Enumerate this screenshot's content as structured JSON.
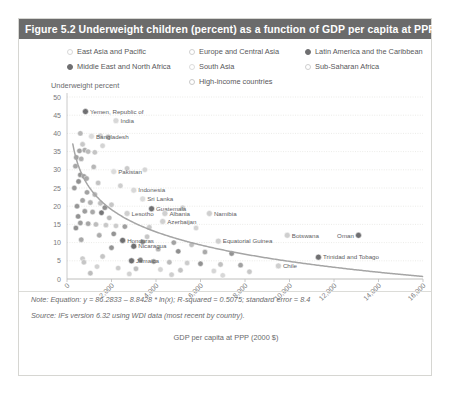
{
  "figure": {
    "title": "Figure 5.2 Underweight children (percent) as a function of GDP per capita at PPP",
    "title_bar_color": "#6b6b6b"
  },
  "legend": {
    "columns": [
      [
        {
          "label": "East Asia and Pacific",
          "color": "#d8d8d8",
          "filled": false
        },
        {
          "label": "Middle East and North Africa",
          "color": "#6f6f71",
          "filled": true
        }
      ],
      [
        {
          "label": "Europe and Central Asia",
          "color": "#d0d0d0",
          "filled": false
        },
        {
          "label": "South Asia",
          "color": "#dcdcdc",
          "filled": false
        },
        {
          "label": "High-income countries",
          "color": "#c8c8c8",
          "filled": false
        }
      ],
      [
        {
          "label": "Latin America and the Caribbean",
          "color": "#6f6f71",
          "filled": true
        },
        {
          "label": "Sub-Saharan Africa",
          "color": "#cfcfcf",
          "filled": false
        }
      ]
    ]
  },
  "notes": {
    "note": "Note: Equation: y = 86.2833 – 8.8428 * ln(x); R-squared = 0.5075; standard error = 8.4",
    "source": "Source: IFs version 6.32 using WDI data (most recent by country)."
  },
  "chart_data": {
    "type": "scatter",
    "title": "Figure 5.2 Underweight children (percent) as a function of GDP per capita at PPP",
    "xlabel": "GDP per capita at PPP (2000 $)",
    "ylabel": "Underweight percent",
    "xlim": [
      0,
      16000
    ],
    "ylim": [
      0,
      50
    ],
    "xticks": [
      0,
      2000,
      4000,
      6000,
      8000,
      10000,
      12000,
      14000,
      16000
    ],
    "xticklabels": [
      "0",
      "2,000",
      "4,000",
      "6,000",
      "8,000",
      "10,000",
      "12,000",
      "14,000",
      "16,000"
    ],
    "yticks": [
      0,
      5,
      10,
      15,
      20,
      25,
      30,
      35,
      40,
      45,
      50
    ],
    "grid": "horizontal",
    "legend_position": "top",
    "trend": {
      "equation": "y = 86.2833 - 8.8428 * ln(x)",
      "r_squared": 0.5075,
      "standard_error": 8.4,
      "intercept": 86.2833,
      "slope_ln": -8.8428
    },
    "annotations": [
      {
        "label": "Yemen, Republic of",
        "x": 830,
        "y": 46.0,
        "color": "#6f6f71"
      },
      {
        "label": "India",
        "x": 2200,
        "y": 43.5,
        "color": "#d8d8d8"
      },
      {
        "label": "Bangladesh",
        "x": 1100,
        "y": 39.2,
        "color": "#dcdcdc"
      },
      {
        "label": "Pakistan",
        "x": 2100,
        "y": 29.5,
        "color": "#dcdcdc"
      },
      {
        "label": "Indonesia",
        "x": 3000,
        "y": 24.4,
        "color": "#d8d8d8"
      },
      {
        "label": "Sri Lanka",
        "x": 3400,
        "y": 22.0,
        "color": "#dcdcdc"
      },
      {
        "label": "Guatemala",
        "x": 3800,
        "y": 19.3,
        "color": "#6f6f71"
      },
      {
        "label": "Lesotho",
        "x": 2700,
        "y": 18.0,
        "color": "#cfcfcf"
      },
      {
        "label": "Albania",
        "x": 4400,
        "y": 18.0,
        "color": "#d0d0d0"
      },
      {
        "label": "Namibia",
        "x": 6400,
        "y": 18.0,
        "color": "#cfcfcf"
      },
      {
        "label": "Azerbaijan",
        "x": 4300,
        "y": 15.8,
        "color": "#d0d0d0"
      },
      {
        "label": "Honduras",
        "x": 2500,
        "y": 10.6,
        "color": "#6f6f71"
      },
      {
        "label": "Nicaragua",
        "x": 3000,
        "y": 9.0,
        "color": "#6f6f71"
      },
      {
        "label": "Equatorial Guinea",
        "x": 6800,
        "y": 10.4,
        "color": "#cfcfcf"
      },
      {
        "label": "Botswana",
        "x": 9900,
        "y": 12.0,
        "color": "#cfcfcf"
      },
      {
        "label": "Oman",
        "x": 13100,
        "y": 12.0,
        "color": "#6f6f71"
      },
      {
        "label": "Trinidad and Tobago",
        "x": 11300,
        "y": 6.0,
        "color": "#6f6f71"
      },
      {
        "label": "Chile",
        "x": 9500,
        "y": 3.6,
        "color": "#cfcfcf"
      },
      {
        "label": "Jamaica",
        "x": 2900,
        "y": 5.0,
        "color": "#6f6f71"
      }
    ],
    "points": [
      {
        "x": 830,
        "y": 46.0,
        "c": "#6f6f71"
      },
      {
        "x": 2200,
        "y": 43.5,
        "c": "#d8d8d8"
      },
      {
        "x": 600,
        "y": 40.0,
        "c": "#b4b4b4"
      },
      {
        "x": 1100,
        "y": 39.2,
        "c": "#dcdcdc"
      },
      {
        "x": 1500,
        "y": 39.4,
        "c": "#cfcfcf"
      },
      {
        "x": 1850,
        "y": 39.0,
        "c": "#b0b0b0"
      },
      {
        "x": 700,
        "y": 37.0,
        "c": "#c6c6c6"
      },
      {
        "x": 1600,
        "y": 36.6,
        "c": "#d2d2d2"
      },
      {
        "x": 560,
        "y": 35.2,
        "c": "#9f9f9f"
      },
      {
        "x": 800,
        "y": 35.4,
        "c": "#a8a8a8"
      },
      {
        "x": 950,
        "y": 35.0,
        "c": "#b8b8b8"
      },
      {
        "x": 1250,
        "y": 34.8,
        "c": "#c2c2c2"
      },
      {
        "x": 420,
        "y": 33.4,
        "c": "#9c9c9c"
      },
      {
        "x": 640,
        "y": 33.0,
        "c": "#acacac"
      },
      {
        "x": 380,
        "y": 31.0,
        "c": "#a2a2a2"
      },
      {
        "x": 2100,
        "y": 29.5,
        "c": "#dcdcdc"
      },
      {
        "x": 2700,
        "y": 30.4,
        "c": "#c8c8c8"
      },
      {
        "x": 3500,
        "y": 30.0,
        "c": "#d4d4d4"
      },
      {
        "x": 600,
        "y": 28.6,
        "c": "#8f8f8f"
      },
      {
        "x": 760,
        "y": 28.2,
        "c": "#9a9a9a"
      },
      {
        "x": 880,
        "y": 27.6,
        "c": "#a6a6a6"
      },
      {
        "x": 520,
        "y": 26.8,
        "c": "#8c8c8c"
      },
      {
        "x": 1400,
        "y": 26.4,
        "c": "#c0c0c0"
      },
      {
        "x": 2400,
        "y": 25.6,
        "c": "#cccccc"
      },
      {
        "x": 3000,
        "y": 24.4,
        "c": "#d8d8d8"
      },
      {
        "x": 900,
        "y": 23.8,
        "c": "#9e9e9e"
      },
      {
        "x": 1250,
        "y": 23.2,
        "c": "#b2b2b2"
      },
      {
        "x": 3400,
        "y": 22.0,
        "c": "#dcdcdc"
      },
      {
        "x": 700,
        "y": 21.6,
        "c": "#a0a0a0"
      },
      {
        "x": 1050,
        "y": 21.0,
        "c": "#aeaeae"
      },
      {
        "x": 1500,
        "y": 20.8,
        "c": "#bcbcbc"
      },
      {
        "x": 2000,
        "y": 20.4,
        "c": "#c4c4c4"
      },
      {
        "x": 450,
        "y": 20.0,
        "c": "#919191"
      },
      {
        "x": 1700,
        "y": 19.6,
        "c": "#8a8a8a"
      },
      {
        "x": 3800,
        "y": 19.3,
        "c": "#6f6f71"
      },
      {
        "x": 5200,
        "y": 19.6,
        "c": "#d0d0d0"
      },
      {
        "x": 800,
        "y": 18.6,
        "c": "#989898"
      },
      {
        "x": 1150,
        "y": 18.4,
        "c": "#a4a4a4"
      },
      {
        "x": 1550,
        "y": 18.2,
        "c": "#6f6f71"
      },
      {
        "x": 2700,
        "y": 18.0,
        "c": "#cfcfcf"
      },
      {
        "x": 4400,
        "y": 18.0,
        "c": "#d0d0d0"
      },
      {
        "x": 6400,
        "y": 18.0,
        "c": "#cfcfcf"
      },
      {
        "x": 500,
        "y": 17.2,
        "c": "#8e8e8e"
      },
      {
        "x": 1900,
        "y": 16.8,
        "c": "#b6b6b6"
      },
      {
        "x": 4300,
        "y": 15.8,
        "c": "#d0d0d0"
      },
      {
        "x": 600,
        "y": 15.4,
        "c": "#969696"
      },
      {
        "x": 950,
        "y": 15.2,
        "c": "#a2a2a2"
      },
      {
        "x": 1300,
        "y": 15.0,
        "c": "#bababa"
      },
      {
        "x": 1750,
        "y": 14.8,
        "c": "#c6c6c6"
      },
      {
        "x": 2200,
        "y": 14.6,
        "c": "#cacaca"
      },
      {
        "x": 2600,
        "y": 14.4,
        "c": "#9a9a9a"
      },
      {
        "x": 400,
        "y": 14.0,
        "c": "#8b8b8b"
      },
      {
        "x": 1450,
        "y": 12.0,
        "c": "#a8a8a8"
      },
      {
        "x": 3600,
        "y": 11.6,
        "c": "#c4c4c4"
      },
      {
        "x": 6800,
        "y": 10.4,
        "c": "#cfcfcf"
      },
      {
        "x": 9900,
        "y": 12.0,
        "c": "#cfcfcf"
      },
      {
        "x": 13100,
        "y": 12.0,
        "c": "#6f6f71"
      },
      {
        "x": 2500,
        "y": 10.6,
        "c": "#6f6f71"
      },
      {
        "x": 3400,
        "y": 10.2,
        "c": "#8c8c8c"
      },
      {
        "x": 4800,
        "y": 10.0,
        "c": "#9e9e9e"
      },
      {
        "x": 5600,
        "y": 9.4,
        "c": "#bcbcbc"
      },
      {
        "x": 3000,
        "y": 9.0,
        "c": "#6f6f71"
      },
      {
        "x": 2000,
        "y": 8.6,
        "c": "#8f8f8f"
      },
      {
        "x": 4100,
        "y": 8.2,
        "c": "#b0b0b0"
      },
      {
        "x": 5000,
        "y": 7.6,
        "c": "#8a8a8a"
      },
      {
        "x": 6200,
        "y": 7.4,
        "c": "#a6a6a6"
      },
      {
        "x": 7400,
        "y": 7.0,
        "c": "#8e8e8e"
      },
      {
        "x": 11300,
        "y": 6.0,
        "c": "#6f6f71"
      },
      {
        "x": 1600,
        "y": 6.2,
        "c": "#c2c2c2"
      },
      {
        "x": 2900,
        "y": 5.0,
        "c": "#6f6f71"
      },
      {
        "x": 3300,
        "y": 5.2,
        "c": "#7d7d7d"
      },
      {
        "x": 3900,
        "y": 4.8,
        "c": "#9a9a9a"
      },
      {
        "x": 4600,
        "y": 4.6,
        "c": "#b8b8b8"
      },
      {
        "x": 5400,
        "y": 4.4,
        "c": "#cacaca"
      },
      {
        "x": 6000,
        "y": 4.2,
        "c": "#8d8d8d"
      },
      {
        "x": 6900,
        "y": 4.0,
        "c": "#bebebe"
      },
      {
        "x": 7800,
        "y": 3.8,
        "c": "#9c9c9c"
      },
      {
        "x": 9500,
        "y": 3.6,
        "c": "#cfcfcf"
      },
      {
        "x": 1350,
        "y": 3.4,
        "c": "#d0d0d0"
      },
      {
        "x": 2300,
        "y": 3.0,
        "c": "#cacaca"
      },
      {
        "x": 3100,
        "y": 2.8,
        "c": "#bcbcbc"
      },
      {
        "x": 4200,
        "y": 2.6,
        "c": "#d2d2d2"
      },
      {
        "x": 5100,
        "y": 2.4,
        "c": "#c0c0c0"
      },
      {
        "x": 6600,
        "y": 2.2,
        "c": "#d4d4d4"
      },
      {
        "x": 8200,
        "y": 2.0,
        "c": "#c6c6c6"
      },
      {
        "x": 1050,
        "y": 1.6,
        "c": "#bababa"
      },
      {
        "x": 2800,
        "y": 1.4,
        "c": "#d0d0d0"
      },
      {
        "x": 4700,
        "y": 1.2,
        "c": "#cccccc"
      },
      {
        "x": 7000,
        "y": 1.0,
        "c": "#d6d6d6"
      },
      {
        "x": 1200,
        "y": 30.8,
        "c": "#b4b4b4"
      },
      {
        "x": 330,
        "y": 25.0,
        "c": "#949494"
      },
      {
        "x": 2100,
        "y": 12.4,
        "c": "#8f8f8f"
      },
      {
        "x": 3700,
        "y": 14.2,
        "c": "#c8c8c8"
      },
      {
        "x": 5800,
        "y": 14.0,
        "c": "#d2d2d2"
      },
      {
        "x": 640,
        "y": 10.8,
        "c": "#a4a4a4"
      },
      {
        "x": 700,
        "y": 5.6,
        "c": "#cacaca"
      },
      {
        "x": 760,
        "y": 4.6,
        "c": "#c4c4c4"
      }
    ]
  }
}
